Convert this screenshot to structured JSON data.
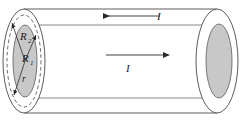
{
  "figure": {
    "type": "physics-diagram",
    "width": 247,
    "height": 122,
    "background_color": "#ffffff",
    "stroke_color": "#3c3c3c",
    "conductor_fill_color": "#c8c8c8",
    "dashed_stroke_color": "#555555"
  },
  "labels": {
    "outer_radius": "R",
    "outer_radius_subscript": "2",
    "inner_radius": "R",
    "inner_radius_subscript": "1",
    "variable_radius": "r",
    "current_top": "I",
    "current_middle": "I"
  },
  "arrows": [
    {
      "name": "current-return-arrow",
      "direction": "left",
      "label": "I",
      "x1": 160,
      "y1": 16,
      "x2": 103,
      "y2": 16
    },
    {
      "name": "current-forward-arrow",
      "direction": "right",
      "label": "I",
      "x1": 106,
      "y1": 55,
      "x2": 163,
      "y2": 55
    }
  ],
  "radius_vectors": [
    {
      "name": "R2",
      "target": "dashed-outer-shell",
      "angle": "up-left"
    },
    {
      "name": "R1",
      "target": "dashed-shell-upper",
      "angle": "up-right"
    },
    {
      "name": "r",
      "target": "lower-boundary",
      "angle": "down-left"
    }
  ],
  "ellipses": {
    "left_outer": {
      "cx": 24,
      "cy": 61,
      "rx": 21,
      "ry": 52
    },
    "left_dashed": {
      "cx": 24,
      "cy": 61,
      "rx": 17,
      "ry": 46
    },
    "left_inner": {
      "cx": 25,
      "cy": 61,
      "rx": 12,
      "ry": 36
    },
    "right_outer": {
      "cx": 217,
      "cy": 61,
      "rx": 21,
      "ry": 52
    },
    "right_inner": {
      "cx": 219,
      "cy": 61,
      "rx": 13,
      "ry": 37
    }
  }
}
